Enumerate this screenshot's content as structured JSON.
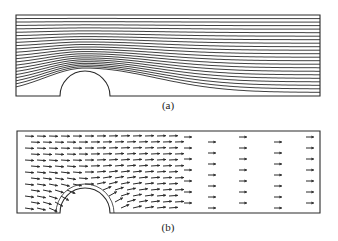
{
  "figure": {
    "panels": [
      {
        "id": "a",
        "caption": "(a)",
        "kind": "streamlines",
        "description": "Streamlines of flow in a channel over a semicircular bump on the bottom wall",
        "frame": {
          "x": 16,
          "y": 15,
          "w": 304,
          "h": 81
        },
        "obstacle": {
          "cx": 85,
          "r": 25
        },
        "streamline_count": 22
      },
      {
        "id": "b",
        "caption": "(b)",
        "kind": "velocity-vectors",
        "description": "Velocity vector field of flow in a channel over a semicircular bump",
        "frame": {
          "x": 17,
          "y": 131,
          "w": 303,
          "h": 82
        },
        "obstacle": {
          "cx": 85,
          "r": 25
        }
      }
    ],
    "colors": {
      "line": "#2a2a2a",
      "background": "#ffffff"
    }
  }
}
